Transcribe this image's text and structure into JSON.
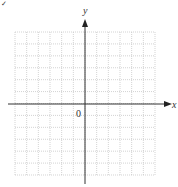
{
  "diagram": {
    "type": "coordinate-plane",
    "x_axis_label": "x",
    "y_axis_label": "y",
    "origin_label": "0",
    "corner_mark": "✓",
    "grid": {
      "columns": 12,
      "rows": 12,
      "style": "dotted"
    },
    "colors": {
      "axis": "#333333",
      "grid": "#c8c8c8",
      "background": "#ffffff"
    }
  }
}
